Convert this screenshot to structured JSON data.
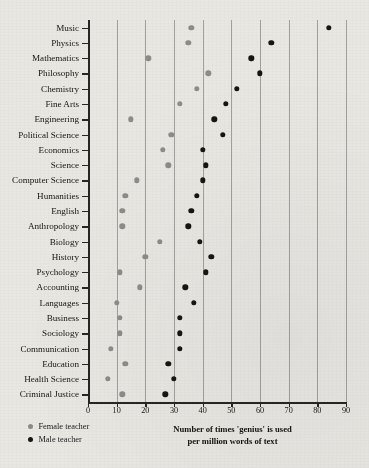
{
  "chart_data": {
    "type": "scatter",
    "title": "",
    "xlabel": "Number of times 'genius' is used per million words of text",
    "ylabel": "",
    "xlim": [
      0,
      90
    ],
    "xticks": [
      0,
      10,
      20,
      30,
      40,
      50,
      60,
      70,
      80,
      90
    ],
    "grid": "vertical",
    "legend_position": "bottom-left",
    "categories": [
      "Music",
      "Physics",
      "Mathematics",
      "Philosophy",
      "Chemistry",
      "Fine Arts",
      "Engineering",
      "Political Science",
      "Economics",
      "Science",
      "Computer Science",
      "Humanities",
      "English",
      "Anthropology",
      "Biology",
      "History",
      "Psychology",
      "Accounting",
      "Languages",
      "Business",
      "Sociology",
      "Communication",
      "Education",
      "Health Science",
      "Criminal Justice"
    ],
    "series": [
      {
        "name": "Female teacher",
        "color": "#8e8c88",
        "values": [
          36,
          35,
          21,
          42,
          38,
          32,
          15,
          29,
          26,
          28,
          17,
          13,
          12,
          12,
          25,
          20,
          11,
          18,
          10,
          11,
          11,
          8,
          13,
          7,
          12
        ]
      },
      {
        "name": "Male teacher",
        "color": "#16150f",
        "values": [
          84,
          64,
          57,
          60,
          52,
          48,
          44,
          47,
          40,
          41,
          40,
          38,
          36,
          35,
          39,
          43,
          41,
          34,
          37,
          32,
          32,
          32,
          28,
          30,
          27
        ]
      }
    ]
  },
  "legend": {
    "items": [
      {
        "label": "Female teacher",
        "key": "female"
      },
      {
        "label": "Male teacher",
        "key": "male"
      }
    ]
  },
  "axis_title": {
    "line1": "Number of times 'genius' is used",
    "line2": "per million words of text"
  }
}
